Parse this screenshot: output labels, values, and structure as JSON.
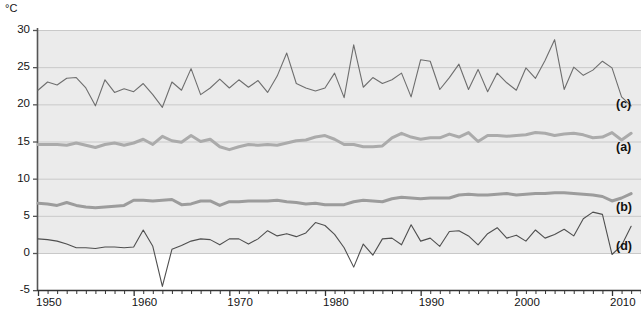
{
  "chart_data": {
    "type": "line",
    "title": "",
    "xlabel": "",
    "ylabel": "°C",
    "unit_label": "°C",
    "xlim": [
      1950,
      2013
    ],
    "ylim": [
      -5,
      30
    ],
    "ytick_values": [
      30,
      25,
      20,
      15,
      10,
      5,
      0,
      -5
    ],
    "ytick_labels": [
      "30",
      "25",
      "20",
      "15",
      "10",
      "5",
      "0",
      "-5"
    ],
    "xtick_values": [
      1950,
      1960,
      1970,
      1980,
      1990,
      2000,
      2010
    ],
    "xtick_labels": [
      "1950",
      "1960",
      "1970",
      "1980",
      "1990",
      "2000",
      "2010"
    ],
    "minor_xticks": "every year",
    "grid": "horizontal gridlines at every 5 degrees",
    "grid_color": "#c9c9c9",
    "plot_band_color": "#ebebeb",
    "plot_band_range": [
      0,
      30
    ],
    "background": "#ffffff",
    "legend": "inline right-edge labels",
    "x": [
      1950,
      1951,
      1952,
      1953,
      1954,
      1955,
      1956,
      1957,
      1958,
      1959,
      1960,
      1961,
      1962,
      1963,
      1964,
      1965,
      1966,
      1967,
      1968,
      1969,
      1970,
      1971,
      1972,
      1973,
      1974,
      1975,
      1976,
      1977,
      1978,
      1979,
      1980,
      1981,
      1982,
      1983,
      1984,
      1985,
      1986,
      1987,
      1988,
      1989,
      1990,
      1991,
      1992,
      1993,
      1994,
      1995,
      1996,
      1997,
      1998,
      1999,
      2000,
      2001,
      2002,
      2003,
      2004,
      2005,
      2006,
      2007,
      2008,
      2009,
      2010,
      2011,
      2012
    ],
    "series": [
      {
        "name": "(c)",
        "label": "(c)",
        "color": "#6e6e6e",
        "width": 1.1,
        "style": "thin",
        "values": [
          21.9,
          23.0,
          22.6,
          23.5,
          23.6,
          22.2,
          19.8,
          23.3,
          21.6,
          22.1,
          21.7,
          22.8,
          21.3,
          19.6,
          23.0,
          21.9,
          24.8,
          21.3,
          22.2,
          23.4,
          22.2,
          23.3,
          22.3,
          23.2,
          21.6,
          23.8,
          26.9,
          22.8,
          22.2,
          21.8,
          22.2,
          24.2,
          20.9,
          28.0,
          22.3,
          23.6,
          22.8,
          23.3,
          24.2,
          21.0,
          26.0,
          25.8,
          22.0,
          23.6,
          25.4,
          22.0,
          24.7,
          21.7,
          24.2,
          22.9,
          21.9,
          24.9,
          23.5,
          25.9,
          28.7,
          22.0,
          25.0,
          23.9,
          24.6,
          25.8,
          24.9,
          21.0,
          19.8
        ]
      },
      {
        "name": "(a)",
        "label": "(a)",
        "color": "#ababab",
        "width": 3.0,
        "style": "thick",
        "values": [
          14.6,
          14.6,
          14.6,
          14.5,
          14.8,
          14.5,
          14.2,
          14.6,
          14.8,
          14.5,
          14.8,
          15.3,
          14.6,
          15.7,
          15.1,
          14.9,
          15.8,
          15.0,
          15.3,
          14.3,
          13.9,
          14.3,
          14.6,
          14.5,
          14.6,
          14.5,
          14.8,
          15.1,
          15.2,
          15.6,
          15.8,
          15.3,
          14.6,
          14.6,
          14.3,
          14.3,
          14.4,
          15.5,
          16.1,
          15.6,
          15.3,
          15.5,
          15.5,
          16.0,
          15.6,
          16.2,
          15.0,
          15.8,
          15.8,
          15.7,
          15.8,
          15.9,
          16.2,
          16.1,
          15.8,
          16.0,
          16.1,
          15.9,
          15.5,
          15.6,
          16.2,
          15.2,
          16.1
        ]
      },
      {
        "name": "(b)",
        "label": "(b)",
        "color": "#9c9c9c",
        "width": 3.0,
        "style": "thick",
        "values": [
          6.7,
          6.6,
          6.4,
          6.8,
          6.4,
          6.2,
          6.1,
          6.2,
          6.3,
          6.4,
          7.1,
          7.1,
          7.0,
          7.1,
          7.2,
          6.5,
          6.6,
          7.0,
          7.0,
          6.4,
          6.9,
          6.9,
          7.0,
          7.0,
          7.0,
          7.1,
          6.9,
          6.8,
          6.6,
          6.7,
          6.5,
          6.5,
          6.5,
          6.9,
          7.1,
          7.0,
          6.9,
          7.3,
          7.5,
          7.4,
          7.3,
          7.4,
          7.4,
          7.4,
          7.8,
          7.9,
          7.8,
          7.8,
          7.9,
          8.0,
          7.8,
          7.9,
          8.0,
          8.0,
          8.1,
          8.1,
          8.0,
          7.9,
          7.8,
          7.6,
          7.0,
          7.4,
          8.0
        ]
      },
      {
        "name": "(d)",
        "label": "(d)",
        "color": "#4f4f4f",
        "width": 1.1,
        "style": "thin",
        "values": [
          1.9,
          1.8,
          1.6,
          1.2,
          0.7,
          0.7,
          0.6,
          0.8,
          0.8,
          0.7,
          0.8,
          3.1,
          0.9,
          -4.5,
          0.5,
          1.0,
          1.6,
          1.9,
          1.8,
          1.1,
          1.9,
          1.9,
          1.2,
          1.9,
          3.0,
          2.3,
          2.6,
          2.2,
          2.7,
          4.1,
          3.7,
          2.5,
          0.7,
          -1.9,
          1.2,
          -0.3,
          1.9,
          2.0,
          1.1,
          3.8,
          1.6,
          2.0,
          0.9,
          2.9,
          3.0,
          2.3,
          1.1,
          2.6,
          3.4,
          2.0,
          2.4,
          1.6,
          3.1,
          2.0,
          2.5,
          3.2,
          2.3,
          4.6,
          5.5,
          5.2,
          -0.2,
          1.0,
          3.6
        ]
      }
    ],
    "series_tags": [
      {
        "label": "(c)",
        "value_y": 20.0
      },
      {
        "label": "(a)",
        "value_y": 14.2
      },
      {
        "label": "(b)",
        "value_y": 6.2
      },
      {
        "label": "(d)",
        "value_y": 1.0
      }
    ]
  }
}
